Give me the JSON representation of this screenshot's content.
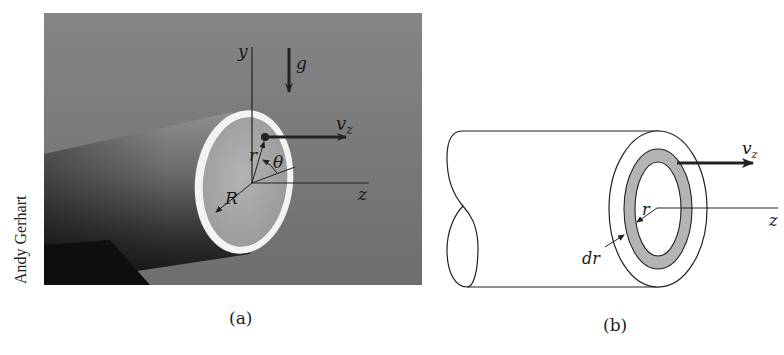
{
  "figure": {
    "panels": [
      {
        "id": "a",
        "caption": "(a)",
        "type": "photograph",
        "photo_credit": "Andy Gerhart",
        "labels": {
          "y_axis": "y",
          "z_axis": "z",
          "gravity": "g",
          "velocity": "v",
          "velocity_subscript": "z",
          "radius_point": "r",
          "angle": "θ",
          "pipe_radius": "R"
        }
      },
      {
        "id": "b",
        "caption": "(b)",
        "type": "line-drawing",
        "labels": {
          "velocity": "v",
          "velocity_subscript": "z",
          "radius": "r",
          "z_axis": "z",
          "shell_thickness": "dr"
        }
      }
    ],
    "colors": {
      "photo_background": "#7a7a7a",
      "pipe_dark": "#1c1c1c",
      "pipe_rim": "#f2f2f2",
      "pipe_face": "#a8a8a8",
      "shell_fill": "#b4b4b4",
      "line": "#1a1a1a"
    }
  }
}
